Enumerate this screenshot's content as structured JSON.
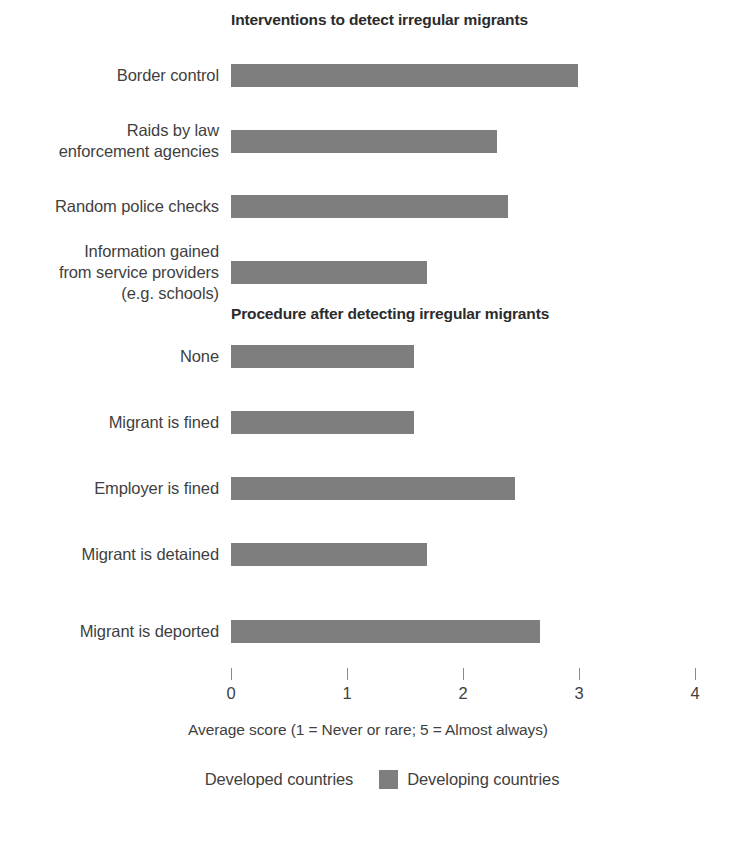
{
  "chart_data": {
    "type": "bar",
    "orientation": "horizontal",
    "title": "",
    "xlabel": "Average score (1 = Never or rare; 5 = Almost always)",
    "ylabel": "",
    "xlim": [
      0,
      4
    ],
    "xticks": [
      0,
      1,
      2,
      3,
      4
    ],
    "xtick_labels": [
      "0",
      "1",
      "2",
      "3",
      "4"
    ],
    "grid": false,
    "legend_position": "bottom",
    "colors": {
      "developed": "#ffffff",
      "developing": "#7e7e7e"
    },
    "series": [
      {
        "name": "Developed countries",
        "values": [
          null,
          null,
          null,
          null,
          null,
          null,
          null,
          null,
          null
        ]
      },
      {
        "name": "Developing countries",
        "values": [
          2.99,
          2.29,
          2.39,
          1.69,
          1.58,
          1.58,
          2.45,
          1.69,
          2.66
        ]
      }
    ],
    "sections": [
      {
        "heading": "Interventions to detect irregular migrants",
        "categories": [
          "Border control",
          "Raids by law\nenforcement agencies",
          "Random police checks",
          "Information gained\nfrom service providers\n(e.g. schools)"
        ],
        "values": [
          2.99,
          2.29,
          2.39,
          1.69
        ]
      },
      {
        "heading": "Procedure after detecting irregular migrants",
        "categories": [
          "None",
          "Migrant is fined",
          "Employer is fined",
          "Migrant is detained",
          "Migrant is deported"
        ],
        "values": [
          1.58,
          1.58,
          2.45,
          1.69,
          2.66
        ]
      }
    ]
  },
  "headings": {
    "interventions": "Interventions to detect irregular migrants",
    "procedure": "Procedure after detecting irregular migrants"
  },
  "rows": [
    {
      "label": "Border control",
      "value": 2.99
    },
    {
      "label": "Raids by law\nenforcement agencies",
      "value": 2.29
    },
    {
      "label": "Random police checks",
      "value": 2.39
    },
    {
      "label": "Information gained\nfrom service providers\n(e.g. schools)",
      "value": 1.69
    },
    {
      "label": "None",
      "value": 1.58
    },
    {
      "label": "Migrant is fined",
      "value": 1.58
    },
    {
      "label": "Employer is fined",
      "value": 2.45
    },
    {
      "label": "Migrant is detained",
      "value": 1.69
    },
    {
      "label": "Migrant is deported",
      "value": 2.66
    }
  ],
  "axis": {
    "title": "Average score (1 = Never or rare; 5 = Almost always)",
    "ticks": [
      "0",
      "1",
      "2",
      "3",
      "4"
    ]
  },
  "legend": {
    "items": [
      {
        "label": "Developed countries",
        "color": "#ffffff"
      },
      {
        "label": "Developing countries",
        "color": "#7e7e7e"
      }
    ]
  }
}
